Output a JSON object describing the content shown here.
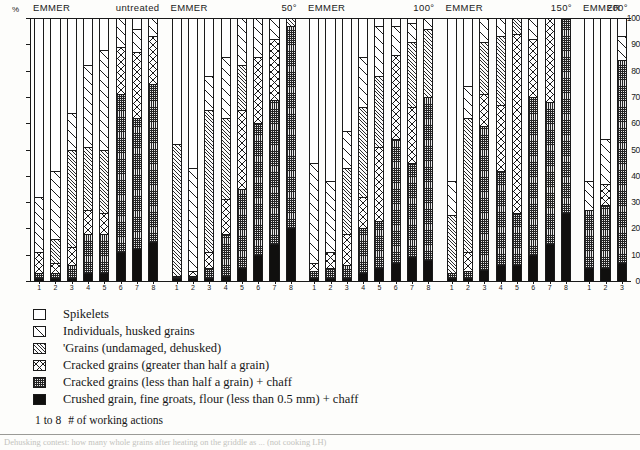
{
  "axes": {
    "y_unit": "%",
    "y_ticks": [
      0,
      10,
      20,
      30,
      40,
      50,
      60,
      70,
      80,
      90,
      100
    ],
    "y_label": "",
    "x_label": ""
  },
  "legend": {
    "items": [
      {
        "key": "spikelets",
        "label": "Spikelets",
        "pattern": "empty-white"
      },
      {
        "key": "individual",
        "label": "Individuals, husked grains",
        "pattern": "single-diagonal"
      },
      {
        "key": "grains",
        "label": "'Grains (undamaged, dehusked)",
        "pattern": "dense-diagonal"
      },
      {
        "key": "cracked_big",
        "label": "Cracked grains (greater than half a grain)",
        "pattern": "cross-diagonal"
      },
      {
        "key": "cracked_small",
        "label": "Cracked grains (less than half a grain) + chaff",
        "pattern": "fine-grid"
      },
      {
        "key": "crushed",
        "label": "Crushed grain, fine groats, flour (less than 0.5 mm) + chaff",
        "pattern": "solid-black"
      }
    ]
  },
  "note": {
    "count": "1 to 8",
    "text": "# of working actions"
  },
  "caption": "Dehusking contest: how many whole grains after heating on the griddle as ... (not cooking LH)",
  "chart_data": {
    "type": "bar",
    "subtype": "stacked-percentage",
    "title": "",
    "xlabel": "# of working actions",
    "ylabel": "%",
    "ylim": [
      0,
      100
    ],
    "grid": false,
    "legend_position": "below-plot",
    "series": [
      {
        "name": "Spikelets",
        "key": "spikelets"
      },
      {
        "name": "Individuals, husked grains",
        "key": "individual"
      },
      {
        "name": "'Grains (undamaged, dehusked)",
        "key": "grains"
      },
      {
        "name": "Cracked grains (greater than half a grain)",
        "key": "cracked_big"
      },
      {
        "name": "Cracked grains (less than half a grain) + chaff",
        "key": "cracked_small"
      },
      {
        "name": "Crushed grain, fine groats, flour (less than 0.5 mm) + chaff",
        "key": "crushed"
      }
    ],
    "groups": [
      {
        "name": "EMMER",
        "treatment": "untreated",
        "categories": [
          "1",
          "2",
          "3",
          "4",
          "5",
          "6",
          "7",
          "8"
        ],
        "bars": [
          {
            "label": "1",
            "spikelets": 68,
            "individual": 21,
            "grains": 0,
            "cracked_big": 8,
            "cracked_small": 2,
            "crushed": 1
          },
          {
            "label": "2",
            "spikelets": 58,
            "individual": 26,
            "grains": 9,
            "cracked_big": 4,
            "cracked_small": 2,
            "crushed": 1
          },
          {
            "label": "3",
            "spikelets": 36,
            "individual": 14,
            "grains": 37,
            "cracked_big": 7,
            "cracked_small": 5,
            "crushed": 1
          },
          {
            "label": "4",
            "spikelets": 18,
            "individual": 31,
            "grains": 24,
            "cracked_big": 9,
            "cracked_small": 15,
            "crushed": 3
          },
          {
            "label": "5",
            "spikelets": 12,
            "individual": 38,
            "grains": 24,
            "cracked_big": 8,
            "cracked_small": 15,
            "crushed": 3
          },
          {
            "label": "6",
            "spikelets": 0,
            "individual": 11,
            "grains": 0,
            "cracked_big": 18,
            "cracked_small": 60,
            "crushed": 11
          },
          {
            "label": "7",
            "spikelets": 4,
            "individual": 9,
            "grains": 0,
            "cracked_big": 25,
            "cracked_small": 50,
            "crushed": 12
          },
          {
            "label": "8",
            "spikelets": 0,
            "individual": 7,
            "grains": 0,
            "cracked_big": 18,
            "cracked_small": 60,
            "crushed": 15
          }
        ]
      },
      {
        "name": "EMMER",
        "treatment": "50°",
        "categories": [
          "1",
          "2",
          "3",
          "4",
          "5",
          "6",
          "7",
          "8"
        ],
        "bars": [
          {
            "label": "1",
            "spikelets": 48,
            "individual": 0,
            "grains": 50,
            "cracked_big": 0,
            "cracked_small": 1,
            "crushed": 1
          },
          {
            "label": "2",
            "spikelets": 57,
            "individual": 39,
            "grains": 0,
            "cracked_big": 2,
            "cracked_small": 1,
            "crushed": 1
          },
          {
            "label": "3",
            "spikelets": 22,
            "individual": 13,
            "grains": 54,
            "cracked_big": 6,
            "cracked_small": 4,
            "crushed": 1
          },
          {
            "label": "4",
            "spikelets": 15,
            "individual": 23,
            "grains": 31,
            "cracked_big": 13,
            "cracked_small": 16,
            "crushed": 2
          },
          {
            "label": "5",
            "spikelets": 0,
            "individual": 18,
            "grains": 17,
            "cracked_big": 30,
            "cracked_small": 30,
            "crushed": 5
          },
          {
            "label": "6",
            "spikelets": 0,
            "individual": 15,
            "grains": 0,
            "cracked_big": 25,
            "cracked_small": 50,
            "crushed": 10
          },
          {
            "label": "7",
            "spikelets": 0,
            "individual": 8,
            "grains": 0,
            "cracked_big": 23,
            "cracked_small": 55,
            "crushed": 14
          },
          {
            "label": "8",
            "spikelets": 0,
            "individual": 0,
            "grains": 3,
            "cracked_big": 0,
            "cracked_small": 77,
            "crushed": 20
          }
        ]
      },
      {
        "name": "EMMER",
        "treatment": "100°",
        "categories": [
          "1",
          "2",
          "3",
          "4",
          "5",
          "6",
          "7",
          "8"
        ],
        "bars": [
          {
            "label": "1",
            "spikelets": 55,
            "individual": 38,
            "grains": 0,
            "cracked_big": 3,
            "cracked_small": 3,
            "crushed": 1
          },
          {
            "label": "2",
            "spikelets": 62,
            "individual": 27,
            "grains": 0,
            "cracked_big": 6,
            "cracked_small": 4,
            "crushed": 1
          },
          {
            "label": "3",
            "spikelets": 43,
            "individual": 14,
            "grains": 25,
            "cracked_big": 12,
            "cracked_small": 5,
            "crushed": 1
          },
          {
            "label": "4",
            "spikelets": 15,
            "individual": 19,
            "grains": 34,
            "cracked_big": 12,
            "cracked_small": 17,
            "crushed": 3
          },
          {
            "label": "5",
            "spikelets": 3,
            "individual": 19,
            "grains": 27,
            "cracked_big": 28,
            "cracked_small": 18,
            "crushed": 5
          },
          {
            "label": "6",
            "spikelets": 3,
            "individual": 11,
            "grains": 0,
            "cracked_big": 32,
            "cracked_small": 47,
            "crushed": 7
          },
          {
            "label": "7",
            "spikelets": 2,
            "individual": 7,
            "grains": 25,
            "cracked_big": 21,
            "cracked_small": 36,
            "crushed": 9
          },
          {
            "label": "8",
            "spikelets": 0,
            "individual": 4,
            "grains": 26,
            "cracked_big": 0,
            "cracked_small": 62,
            "crushed": 8
          }
        ]
      },
      {
        "name": "EMMER",
        "treatment": "150°",
        "categories": [
          "1",
          "2",
          "3",
          "4",
          "5",
          "6",
          "7",
          "8"
        ],
        "bars": [
          {
            "label": "1",
            "spikelets": 62,
            "individual": 13,
            "grains": 22,
            "cracked_big": 0,
            "cracked_small": 2,
            "crushed": 1
          },
          {
            "label": "2",
            "spikelets": 26,
            "individual": 12,
            "grains": 51,
            "cracked_big": 7,
            "cracked_small": 3,
            "crushed": 1
          },
          {
            "label": "3",
            "spikelets": 0,
            "individual": 9,
            "grains": 20,
            "cracked_big": 12,
            "cracked_small": 55,
            "crushed": 4
          },
          {
            "label": "4",
            "spikelets": 0,
            "individual": 7,
            "grains": 26,
            "cracked_big": 25,
            "cracked_small": 36,
            "crushed": 6
          },
          {
            "label": "5",
            "spikelets": 0,
            "individual": 0,
            "grains": 6,
            "cracked_big": 68,
            "cracked_small": 20,
            "crushed": 6
          },
          {
            "label": "6",
            "spikelets": 0,
            "individual": 8,
            "grains": 0,
            "cracked_big": 22,
            "cracked_small": 60,
            "crushed": 10
          },
          {
            "label": "7",
            "spikelets": 0,
            "individual": 0,
            "grains": 0,
            "cracked_big": 32,
            "cracked_small": 54,
            "crushed": 14
          },
          {
            "label": "8",
            "spikelets": 0,
            "individual": 0,
            "grains": 0,
            "cracked_big": 0,
            "cracked_small": 74,
            "crushed": 26
          }
        ]
      },
      {
        "name": "EMMER",
        "treatment": "200°",
        "categories": [
          "1",
          "2",
          "3"
        ],
        "bars": [
          {
            "label": "1",
            "spikelets": 62,
            "individual": 11,
            "grains": 0,
            "cracked_big": 0,
            "cracked_small": 22,
            "crushed": 5
          },
          {
            "label": "2",
            "spikelets": 46,
            "individual": 17,
            "grains": 0,
            "cracked_big": 8,
            "cracked_small": 24,
            "crushed": 5
          },
          {
            "label": "3",
            "spikelets": 7,
            "individual": 9,
            "grains": 0,
            "cracked_big": 0,
            "cracked_small": 77,
            "crushed": 7
          }
        ]
      }
    ]
  }
}
